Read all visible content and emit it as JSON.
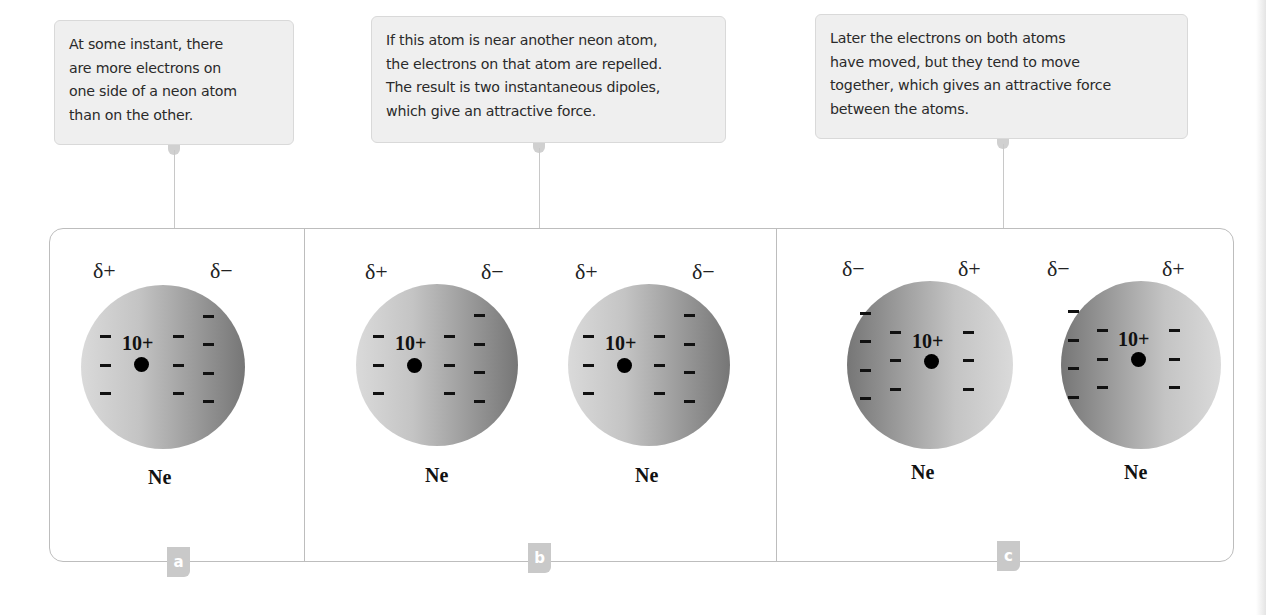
{
  "callouts": [
    {
      "id": "a",
      "lines": [
        "At some instant, there",
        "are more electrons on",
        "one side of a neon atom",
        "than on the other."
      ]
    },
    {
      "id": "b",
      "lines": [
        "If this atom is near another neon atom,",
        "the electrons on that atom are repelled.",
        "The result is two instantaneous dipoles,",
        "which give an attractive force."
      ]
    },
    {
      "id": "c",
      "lines": [
        "Later the electrons on both atoms",
        "have moved, but they tend to move",
        "together, which gives an attractive force",
        "between the atoms."
      ]
    }
  ],
  "panels": [
    {
      "label": "a",
      "atoms": [
        {
          "element": "Ne",
          "nuclear_charge": "10+",
          "left_delta": "δ+",
          "right_delta": "δ−",
          "electron_bias": "right"
        }
      ]
    },
    {
      "label": "b",
      "atoms": [
        {
          "element": "Ne",
          "nuclear_charge": "10+",
          "left_delta": "δ+",
          "right_delta": "δ−",
          "electron_bias": "right"
        },
        {
          "element": "Ne",
          "nuclear_charge": "10+",
          "left_delta": "δ+",
          "right_delta": "δ−",
          "electron_bias": "right"
        }
      ]
    },
    {
      "label": "c",
      "atoms": [
        {
          "element": "Ne",
          "nuclear_charge": "10+",
          "left_delta": "δ−",
          "right_delta": "δ+",
          "electron_bias": "left"
        },
        {
          "element": "Ne",
          "nuclear_charge": "10+",
          "left_delta": "δ−",
          "right_delta": "δ+",
          "electron_bias": "left"
        }
      ]
    }
  ],
  "colors": {
    "callout_bg": "#efefef",
    "badge_bg": "#c9c9c9",
    "border": "#bdbdbd",
    "atom_light": "#dadada",
    "atom_dark": "#767676"
  }
}
